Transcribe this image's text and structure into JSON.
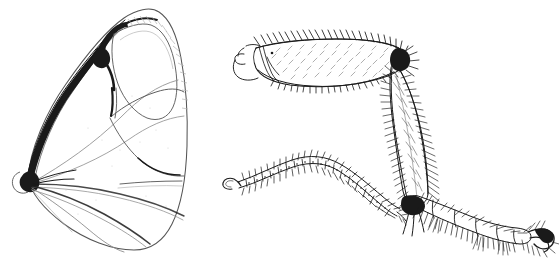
{
  "plate": {
    "kind": "scientific-line-drawing",
    "medium": "pen-and-ink stipple and hatch",
    "background_color": "#ffffff",
    "ink_color": "#1a1a1a",
    "width_px": 559,
    "height_px": 273,
    "caption": "",
    "labels": []
  },
  "figures": [
    {
      "id": "wing",
      "name": "insect-wing",
      "description": "Left figure: an insect forewing in outline, broad and rounded apically, narrowing to a basal articulation at lower left where thickened dark veins converge; interior divided by longitudinal veins into elongate cells.",
      "bbox": [
        10,
        8,
        200,
        252
      ],
      "parts": [
        {
          "name": "wing-apex",
          "note": "rounded distal margin upper right"
        },
        {
          "name": "costal-margin",
          "note": "leading edge, heavily sclerotised and dark"
        },
        {
          "name": "anal-margin",
          "note": "trailing edge, thin pale outline"
        },
        {
          "name": "wing-base",
          "note": "basal articulation at lower left, veins converge"
        },
        {
          "name": "radial-vein",
          "note": "thick dark vein along costa"
        },
        {
          "name": "median-veins",
          "note": "pale branching veins crossing the disc"
        },
        {
          "name": "discal-cell",
          "note": "large central cell"
        },
        {
          "name": "anal-veins",
          "note": "three long pale veins sweeping to trailing margin"
        }
      ]
    },
    {
      "id": "leg",
      "name": "insect-hind-leg",
      "description": "Right figure: a hind leg seen laterally — a broad setose femur directed left, angled downward to a long densely hairy tibia, then to a slender multi-segmented tarsus ending in claws at lower right.",
      "bbox": [
        230,
        32,
        329,
        253
      ],
      "parts": [
        {
          "name": "trochanter",
          "note": "small proximal segment at far left of femur"
        },
        {
          "name": "femur",
          "note": "broad flattened segment with dense short setae and marginal bristles"
        },
        {
          "name": "knee-joint",
          "note": "femoro-tibial articulation upper right"
        },
        {
          "name": "tibia",
          "note": "long segment clothed in dense long hairs"
        },
        {
          "name": "tibial-spurs",
          "note": "apical spurs at distal tibia"
        },
        {
          "name": "tarsus",
          "note": "five slender tarsomeres bearing spines"
        },
        {
          "name": "pretarsal-claws",
          "note": "paired curved claws at the tip"
        }
      ]
    },
    {
      "id": "antenna",
      "name": "insect-antenna",
      "description": "Middle-right figure: a slender arched multi-articulate antenna, each segment ringed with whorls of short bristles, tapering to a fine apex at lower right and a small basal scape hook at lower left.",
      "bbox": [
        222,
        152,
        170,
        60
      ],
      "parts": [
        {
          "name": "scape",
          "note": "hooked basal segment at left"
        },
        {
          "name": "pedicel",
          "note": "second segment"
        },
        {
          "name": "flagellum",
          "note": "chain of ringed flagellomeres with verticillate setae"
        },
        {
          "name": "antennal-apex",
          "note": "tapered distal tip at lower right"
        }
      ]
    }
  ]
}
